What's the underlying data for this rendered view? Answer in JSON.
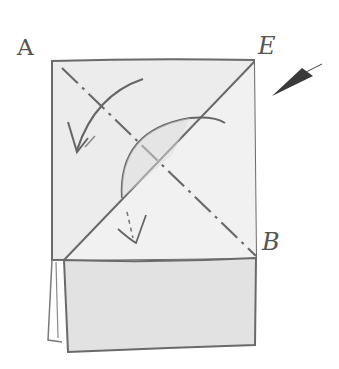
{
  "diagram": {
    "labels": {
      "corner_top_left": "A",
      "corner_top_right": "E",
      "corner_right_mid": "B"
    },
    "colors": {
      "paper": "#ececec",
      "paper_front": "#e2e2e2",
      "stroke": "#6a6a6a",
      "text": "#555555"
    },
    "elements": [
      {
        "type": "paper-sheet",
        "description": "rectangular sheet"
      },
      {
        "type": "valley-fold-line",
        "from": "A",
        "to": "B",
        "style": "dash-dot"
      },
      {
        "type": "fold-line",
        "from": "E",
        "to": "lower-left",
        "style": "solid"
      },
      {
        "type": "fold-arrow",
        "description": "curved arrow folding corner down-left"
      },
      {
        "type": "fold-arrow",
        "description": "curved arc arrow over diagonal"
      },
      {
        "type": "push-arrow",
        "description": "small dashed arrow pointing down"
      },
      {
        "type": "pointer-arrow",
        "description": "dark wedge pointing at corner E"
      },
      {
        "type": "folded-flap",
        "description": "bottom folded rectangle with layered edges"
      }
    ]
  }
}
